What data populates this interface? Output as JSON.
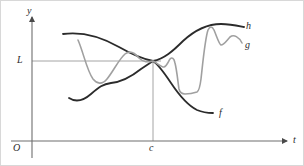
{
  "figure": {
    "border_color": "#d8d8d8",
    "background": "#ffffff"
  },
  "axes": {
    "x_axis": {
      "label": "t",
      "label_x": 292,
      "label_y": 134,
      "color": "#6e6e6e",
      "y_pixel": 140,
      "x_start": 10,
      "x_end": 288,
      "arrow": true
    },
    "y_axis": {
      "label": "y",
      "label_x": 26,
      "label_y": 5,
      "color": "#6e6e6e",
      "x_pixel": 31,
      "y_start": 157,
      "y_end": 14,
      "arrow": true
    },
    "origin": {
      "label": "O",
      "label_x": 12,
      "label_y": 142
    }
  },
  "guides": {
    "horizontal": {
      "label": "L",
      "label_x": 16,
      "label_y": 54,
      "y_pixel": 60,
      "x_start": 31,
      "x_end": 160,
      "color": "#9a9a9a"
    },
    "vertical": {
      "label": "c",
      "label_x": 148,
      "label_y": 142,
      "x_pixel": 152,
      "y_start": 60,
      "y_end": 140,
      "color": "#9a9a9a"
    }
  },
  "chart_data": {
    "type": "line",
    "xlabel": "t",
    "ylabel": "y",
    "annotations": [
      "L",
      "c",
      "O"
    ],
    "limit_point": {
      "x": 152,
      "y": 60,
      "x_label": "c",
      "y_label": "L"
    },
    "series": [
      {
        "name": "h",
        "label": "h",
        "label_x": 245,
        "label_y": 20,
        "color": "#2b2b2b",
        "width": 1.8,
        "role": "upper-bound",
        "path": "M62,33 C84,30 104,38 118,46 C132,54 142,58 152,60 C163,58 172,50 182,40 C194,29 208,23 220,23 C230,23 238,25 243,26"
      },
      {
        "name": "f",
        "label": "f",
        "label_x": 218,
        "label_y": 107,
        "color": "#2b2b2b",
        "width": 1.8,
        "role": "lower-bound",
        "path": "M68,97 C74,101 82,100 90,93 C98,86 102,83 110,82 C120,81 130,76 140,68 C146,64 149,62 152,60 C158,64 164,73 170,82 C178,94 186,104 196,109 C203,112 208,112 212,112"
      },
      {
        "name": "g",
        "label": "g",
        "label_x": 244,
        "label_y": 39,
        "color": "#a0a0a0",
        "width": 1.6,
        "role": "squeezed",
        "path": "M77,39 C82,50 86,70 92,78 C96,83 101,84 106,78 C112,71 118,58 124,53 C129,49 134,52 138,57 C143,62 147,61 152,60 C156,62 160,66 163,66 C166,65 167,61 169,58 C171,56 173,57 174,62 C176,70 177,82 178,88 C179,92 181,93 184,93 C188,93 193,92 196,91 C198,90 199,86 200,78 C202,60 204,38 207,29 C209,25 211,25 213,29 C216,36 218,43 220,44 C223,44 226,39 229,36 C233,33 238,36 241,42"
      }
    ]
  }
}
